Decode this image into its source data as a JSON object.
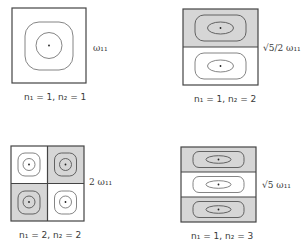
{
  "colors": {
    "shaded": "#d6d6d6",
    "line": "#444444",
    "contour": "#666666",
    "background": "#ffffff"
  },
  "modes": [
    {
      "id": "mode-1-1",
      "n1": 1,
      "n2": 1,
      "caption": "n₁ = 1, n₂ = 1",
      "frequency_label": "ω₁₁",
      "layout": "1x1",
      "cells_shaded": [
        false
      ]
    },
    {
      "id": "mode-1-2",
      "n1": 1,
      "n2": 2,
      "caption": "n₁ = 1, n₂ = 2",
      "frequency_label": "√5/2 ω₁₁",
      "layout": "2 rows",
      "cells_shaded": [
        true,
        false
      ]
    },
    {
      "id": "mode-2-2",
      "n1": 2,
      "n2": 2,
      "caption": "n₁ = 2, n₂ = 2",
      "frequency_label": "2 ω₁₁",
      "layout": "2x2",
      "cells_shaded": [
        false,
        true,
        true,
        false
      ]
    },
    {
      "id": "mode-1-3",
      "n1": 1,
      "n2": 3,
      "caption": "n₁ = 1, n₂ = 3",
      "frequency_label": "√5 ω₁₁",
      "layout": "3 rows",
      "cells_shaded": [
        true,
        false,
        true
      ]
    }
  ]
}
